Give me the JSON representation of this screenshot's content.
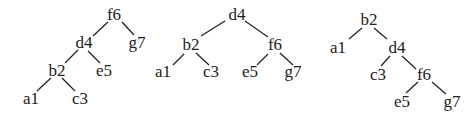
{
  "diagram": {
    "type": "binary-search-trees",
    "trees": [
      {
        "id": "tree-1",
        "description": "left-leaning (right-rotated) tree rooted at f6",
        "nodes": [
          {
            "id": "f6",
            "label": "f6",
            "x": 114,
            "y": 20
          },
          {
            "id": "d4",
            "label": "d4",
            "x": 84,
            "y": 48
          },
          {
            "id": "g7",
            "label": "g7",
            "x": 137,
            "y": 48
          },
          {
            "id": "b2",
            "label": "b2",
            "x": 57,
            "y": 76
          },
          {
            "id": "e5",
            "label": "e5",
            "x": 104,
            "y": 76
          },
          {
            "id": "a1",
            "label": "a1",
            "x": 31,
            "y": 104
          },
          {
            "id": "c3",
            "label": "c3",
            "x": 80,
            "y": 104
          }
        ],
        "edges": [
          {
            "from": "f6",
            "to": "d4",
            "x1": 108,
            "y1": 22,
            "x2": 93,
            "y2": 36
          },
          {
            "from": "f6",
            "to": "g7",
            "x1": 122,
            "y1": 22,
            "x2": 134,
            "y2": 35
          },
          {
            "from": "d4",
            "to": "b2",
            "x1": 78,
            "y1": 50,
            "x2": 65,
            "y2": 63
          },
          {
            "from": "d4",
            "to": "e5",
            "x1": 88,
            "y1": 51,
            "x2": 100,
            "y2": 63
          },
          {
            "from": "b2",
            "to": "a1",
            "x1": 51,
            "y1": 78,
            "x2": 37,
            "y2": 91
          },
          {
            "from": "b2",
            "to": "c3",
            "x1": 62,
            "y1": 78,
            "x2": 75,
            "y2": 91
          }
        ]
      },
      {
        "id": "tree-2",
        "description": "balanced tree rooted at d4",
        "nodes": [
          {
            "id": "d4",
            "label": "d4",
            "x": 237,
            "y": 20
          },
          {
            "id": "b2",
            "label": "b2",
            "x": 191,
            "y": 50
          },
          {
            "id": "f6",
            "label": "f6",
            "x": 275,
            "y": 50
          },
          {
            "id": "a1",
            "label": "a1",
            "x": 163,
            "y": 77
          },
          {
            "id": "c3",
            "label": "c3",
            "x": 211,
            "y": 77
          },
          {
            "id": "e5",
            "label": "e5",
            "x": 250,
            "y": 77
          },
          {
            "id": "g7",
            "label": "g7",
            "x": 293,
            "y": 77
          }
        ],
        "edges": [
          {
            "from": "d4",
            "to": "b2",
            "x1": 225,
            "y1": 21,
            "x2": 201,
            "y2": 36
          },
          {
            "from": "d4",
            "to": "f6",
            "x1": 245,
            "y1": 21,
            "x2": 268,
            "y2": 37
          },
          {
            "from": "b2",
            "to": "a1",
            "x1": 184,
            "y1": 54,
            "x2": 173,
            "y2": 65
          },
          {
            "from": "b2",
            "to": "c3",
            "x1": 196,
            "y1": 53,
            "x2": 209,
            "y2": 65
          },
          {
            "from": "f6",
            "to": "e5",
            "x1": 268,
            "y1": 54,
            "x2": 257,
            "y2": 65
          },
          {
            "from": "f6",
            "to": "g7",
            "x1": 280,
            "y1": 53,
            "x2": 293,
            "y2": 65
          }
        ]
      },
      {
        "id": "tree-3",
        "description": "right-leaning (left-rotated) tree rooted at b2",
        "nodes": [
          {
            "id": "b2",
            "label": "b2",
            "x": 369,
            "y": 25
          },
          {
            "id": "a1",
            "label": "a1",
            "x": 338,
            "y": 53
          },
          {
            "id": "d4",
            "label": "d4",
            "x": 397,
            "y": 53
          },
          {
            "id": "c3",
            "label": "c3",
            "x": 378,
            "y": 80
          },
          {
            "id": "f6",
            "label": "f6",
            "x": 424,
            "y": 80
          },
          {
            "id": "e5",
            "label": "e5",
            "x": 402,
            "y": 107
          },
          {
            "id": "g7",
            "label": "g7",
            "x": 452,
            "y": 107
          }
        ],
        "edges": [
          {
            "from": "b2",
            "to": "a1",
            "x1": 362,
            "y1": 28,
            "x2": 349,
            "y2": 39
          },
          {
            "from": "b2",
            "to": "d4",
            "x1": 374,
            "y1": 28,
            "x2": 387,
            "y2": 39
          },
          {
            "from": "d4",
            "to": "c3",
            "x1": 390,
            "y1": 56,
            "x2": 381,
            "y2": 66
          },
          {
            "from": "d4",
            "to": "f6",
            "x1": 402,
            "y1": 56,
            "x2": 416,
            "y2": 69
          },
          {
            "from": "f6",
            "to": "e5",
            "x1": 418,
            "y1": 82,
            "x2": 406,
            "y2": 93
          },
          {
            "from": "f6",
            "to": "g7",
            "x1": 432,
            "y1": 82,
            "x2": 446,
            "y2": 94
          }
        ]
      }
    ]
  }
}
